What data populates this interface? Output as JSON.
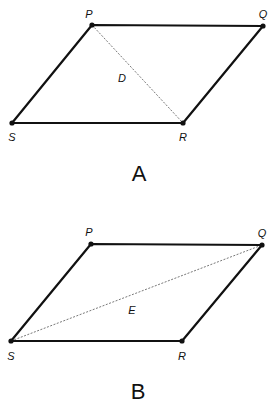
{
  "figures": [
    {
      "caption": "A",
      "diagonal_label": "D",
      "vertices": {
        "P": {
          "label": "P",
          "x": 92,
          "y": 25
        },
        "Q": {
          "label": "Q",
          "x": 263,
          "y": 26
        },
        "R": {
          "label": "R",
          "x": 183,
          "y": 123
        },
        "S": {
          "label": "S",
          "x": 12,
          "y": 123
        }
      },
      "diagonal": [
        "P",
        "R"
      ]
    },
    {
      "caption": "B",
      "diagonal_label": "E",
      "vertices": {
        "P": {
          "label": "P",
          "x": 91,
          "y": 244
        },
        "Q": {
          "label": "Q",
          "x": 262,
          "y": 245
        },
        "R": {
          "label": "R",
          "x": 182,
          "y": 341
        },
        "S": {
          "label": "S",
          "x": 11,
          "y": 341
        }
      },
      "diagonal": [
        "S",
        "Q"
      ]
    }
  ],
  "colors": {
    "stroke": "#111111",
    "diagonal": "#555555",
    "background": "#ffffff"
  }
}
